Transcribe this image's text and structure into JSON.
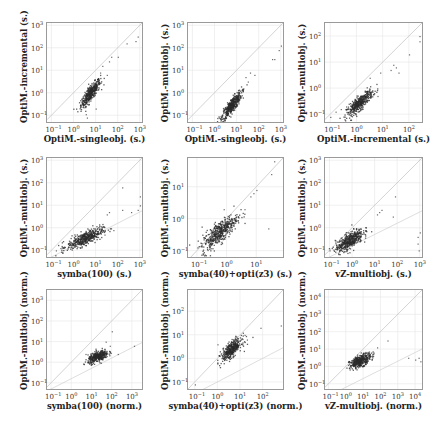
{
  "figure": {
    "layout": {
      "rows": 3,
      "cols": 3
    },
    "colors": {
      "point": "#2b2b2b",
      "diagonal": "#c8c8c8",
      "grid": "#e6e6e6",
      "frame": "#9a9a9a",
      "ratio_line": "#d0d0d0"
    }
  },
  "chart_data": [
    {
      "type": "scatter",
      "id": "p11",
      "xlabel": "OptiM.-singleobj. (s.)",
      "ylabel": "OptiM.-incremental (s.)",
      "xlim_log": [
        -1.2,
        3.1
      ],
      "ylim_log": [
        -1.3,
        3.1
      ],
      "xticks": [
        "-1",
        "0",
        "1",
        "2",
        "3"
      ],
      "yticks": [
        "-1",
        "0",
        "1",
        "2",
        "3"
      ],
      "diagonal": true,
      "ratio_lines": [],
      "cluster": {
        "cx": 0.75,
        "cy": 0.0,
        "sx": 0.22,
        "sy": 0.3,
        "rho": 0.85,
        "n": 420
      },
      "outliers": [
        [
          1.3,
          1.2
        ],
        [
          1.6,
          1.4
        ],
        [
          1.7,
          1.6
        ],
        [
          2.0,
          1.6
        ],
        [
          2.4,
          2.2
        ],
        [
          2.9,
          2.5
        ],
        [
          2.8,
          2.3
        ],
        [
          0.6,
          -1.1
        ],
        [
          0.55,
          -0.95
        ],
        [
          1.0,
          -0.7
        ],
        [
          1.5,
          0.8
        ],
        [
          1.2,
          0.9
        ]
      ],
      "frame": {
        "left": 46,
        "top": 22,
        "width": 97,
        "height": 101
      }
    },
    {
      "type": "scatter",
      "id": "p12",
      "xlabel": "OptiM.-singleobj. (s.)",
      "ylabel": "OptiM.-multiobj. (s.)",
      "xlim_log": [
        -1.2,
        3.1
      ],
      "ylim_log": [
        -1.3,
        3.1
      ],
      "xticks": [
        "-1",
        "0",
        "1",
        "2",
        "3"
      ],
      "yticks": [
        "-1",
        "0",
        "1",
        "2",
        "3"
      ],
      "diagonal": true,
      "ratio_lines": [],
      "cluster": {
        "cx": 0.75,
        "cy": -0.55,
        "sx": 0.22,
        "sy": 0.3,
        "rho": 0.85,
        "n": 420
      },
      "outliers": [
        [
          1.4,
          0.7
        ],
        [
          1.6,
          0.9
        ],
        [
          1.8,
          0.8
        ],
        [
          2.6,
          1.5
        ],
        [
          2.7,
          1.5
        ],
        [
          3.0,
          2.1
        ],
        [
          2.9,
          1.9
        ],
        [
          0.2,
          -1.1
        ],
        [
          1.3,
          0.2
        ],
        [
          1.5,
          0.5
        ]
      ],
      "frame": {
        "left": 187,
        "top": 22,
        "width": 97,
        "height": 101
      }
    },
    {
      "type": "scatter",
      "id": "p13",
      "xlabel": "OptiM.-incremental (s.)",
      "ylabel": "OptiM.-multiobj. (s.)",
      "xlim_log": [
        -1.2,
        2.5
      ],
      "ylim_log": [
        -1.3,
        2.5
      ],
      "xticks": [
        "-1",
        "0",
        "1",
        "2"
      ],
      "yticks": [
        "-1",
        "0",
        "1",
        "2"
      ],
      "diagonal": true,
      "ratio_lines": [],
      "cluster": {
        "cx": 0.1,
        "cy": -0.55,
        "sx": 0.25,
        "sy": 0.25,
        "rho": 0.85,
        "n": 420
      },
      "outliers": [
        [
          -1.0,
          -1.1
        ],
        [
          -0.8,
          -0.9
        ],
        [
          -0.6,
          -0.8
        ],
        [
          -0.4,
          -0.7
        ],
        [
          0.5,
          0.4
        ],
        [
          0.9,
          0.6
        ],
        [
          1.3,
          0.7
        ],
        [
          1.4,
          0.9
        ],
        [
          1.5,
          0.8
        ],
        [
          1.6,
          0.6
        ],
        [
          2.0,
          1.3
        ],
        [
          2.4,
          2.0
        ],
        [
          2.4,
          1.8
        ],
        [
          0.8,
          -0.3
        ]
      ],
      "frame": {
        "left": 324,
        "top": 22,
        "width": 99,
        "height": 101
      }
    },
    {
      "type": "scatter",
      "id": "p21",
      "xlabel": "symba(100) (s.)",
      "ylabel": "OptiM.-multiobj. (s.)",
      "xlim_log": [
        -1.2,
        3.1
      ],
      "ylim_log": [
        -1.3,
        3.1
      ],
      "xticks": [
        "-1",
        "0",
        "1",
        "2",
        "3"
      ],
      "yticks": [
        "-1",
        "0",
        "1",
        "2",
        "3"
      ],
      "diagonal": true,
      "ratio_lines": [
        -2.2
      ],
      "cluster": {
        "cx": 0.5,
        "cy": -0.45,
        "sx": 0.4,
        "sy": 0.22,
        "rho": 0.75,
        "n": 450
      },
      "outliers": [
        [
          -0.6,
          -0.9
        ],
        [
          -0.5,
          -1.1
        ],
        [
          -0.8,
          -1.0
        ],
        [
          1.6,
          0.7
        ],
        [
          1.5,
          0.6
        ],
        [
          2.2,
          0.8
        ],
        [
          2.9,
          0.8
        ],
        [
          3.0,
          1.4
        ],
        [
          3.0,
          1.0
        ],
        [
          2.6,
          0.7
        ],
        [
          1.8,
          -0.1
        ],
        [
          1.4,
          -0.3
        ],
        [
          2.2,
          1.8
        ]
      ],
      "frame": {
        "left": 46,
        "top": 157,
        "width": 97,
        "height": 101
      }
    },
    {
      "type": "scatter",
      "id": "p22",
      "xlabel": "symba(40)+opti(z3) (s.)",
      "ylabel": "OptiM.-multiobj. (s.)",
      "xlim_log": [
        -1.3,
        1.9
      ],
      "ylim_log": [
        -1.2,
        1.9
      ],
      "xticks": [
        "-1",
        "0",
        "1"
      ],
      "yticks": [
        "-1",
        "0",
        "1"
      ],
      "diagonal": true,
      "ratio_lines": [],
      "cluster": {
        "cx": -0.25,
        "cy": -0.4,
        "sx": 0.3,
        "sy": 0.28,
        "rho": 0.8,
        "n": 460
      },
      "outliers": [
        [
          0.9,
          0.8
        ],
        [
          1.0,
          0.9
        ],
        [
          0.8,
          0.7
        ],
        [
          1.5,
          1.4
        ],
        [
          1.6,
          1.8
        ],
        [
          1.4,
          -0.3
        ],
        [
          0.6,
          0.3
        ],
        [
          0.3,
          0.0
        ],
        [
          -0.1,
          0.3
        ]
      ],
      "frame": {
        "left": 187,
        "top": 157,
        "width": 97,
        "height": 101
      }
    },
    {
      "type": "scatter",
      "id": "p23",
      "xlabel": "vZ-multiobj. (s.)",
      "ylabel": "OptiM.-multiobj. (s.)",
      "xlim_log": [
        -1.2,
        3.1
      ],
      "ylim_log": [
        -1.3,
        3.1
      ],
      "xticks": [
        "-1",
        "0",
        "1",
        "2",
        "3"
      ],
      "yticks": [
        "-1",
        "0",
        "1",
        "2",
        "3"
      ],
      "diagonal": true,
      "ratio_lines": [
        -2.2
      ],
      "cluster": {
        "cx": -0.15,
        "cy": -0.55,
        "sx": 0.3,
        "sy": 0.25,
        "rho": 0.7,
        "n": 450
      },
      "outliers": [
        [
          -0.9,
          -0.9
        ],
        [
          -1.0,
          -1.0
        ],
        [
          1.2,
          0.7
        ],
        [
          1.3,
          0.8
        ],
        [
          1.1,
          0.6
        ],
        [
          1.9,
          1.4
        ],
        [
          2.9,
          -0.4
        ],
        [
          2.9,
          -0.7
        ],
        [
          2.95,
          -1.0
        ],
        [
          3.0,
          -0.2
        ],
        [
          0.6,
          -0.1
        ],
        [
          1.8,
          0.5
        ]
      ],
      "frame": {
        "left": 324,
        "top": 157,
        "width": 99,
        "height": 101
      }
    },
    {
      "type": "scatter",
      "id": "p31",
      "xlabel": "symba(100) (norm.)",
      "ylabel": "OptiM.-multiobj. (norm.)",
      "xlim_log": [
        -1.2,
        3.5
      ],
      "ylim_log": [
        -1.3,
        3.5
      ],
      "xticks": [
        "-1",
        "0",
        "1",
        "2",
        "3"
      ],
      "yticks": [
        "-1",
        "0",
        "1",
        "2",
        "3"
      ],
      "diagonal": true,
      "ratio_lines": [
        -2.2
      ],
      "cluster": {
        "cx": 1.3,
        "cy": 0.3,
        "sx": 0.25,
        "sy": 0.15,
        "rho": 0.6,
        "n": 380
      },
      "outliers": [
        [
          2.0,
          1.5
        ],
        [
          1.7,
          1.0
        ],
        [
          1.9,
          0.8
        ],
        [
          3.1,
          0.8
        ],
        [
          0.7,
          0.4
        ],
        [
          2.3,
          0.4
        ]
      ],
      "frame": {
        "left": 46,
        "top": 289,
        "width": 97,
        "height": 101
      }
    },
    {
      "type": "scatter",
      "id": "p32",
      "xlabel": "symba(40)+opti(z3) (norm.)",
      "ylabel": "OptiM.-multiobj. (norm.)",
      "xlim_log": [
        -1.3,
        2.9
      ],
      "ylim_log": [
        -1.3,
        2.9
      ],
      "xticks": [
        "-1",
        "0",
        "1",
        "2"
      ],
      "yticks": [
        "-1",
        "0",
        "1",
        "2"
      ],
      "diagonal": true,
      "ratio_lines": [
        -2.6
      ],
      "cluster": {
        "cx": 0.6,
        "cy": 0.4,
        "sx": 0.22,
        "sy": 0.22,
        "rho": 0.7,
        "n": 400
      },
      "outliers": [
        [
          1.2,
          1.0
        ],
        [
          1.9,
          1.3
        ],
        [
          2.8,
          1.4
        ],
        [
          -1.0,
          -1.1
        ],
        [
          0.0,
          0.6
        ],
        [
          1.3,
          0.8
        ]
      ],
      "frame": {
        "left": 187,
        "top": 289,
        "width": 97,
        "height": 101
      }
    },
    {
      "type": "scatter",
      "id": "p33",
      "xlabel": "vZ-multiobj. (norm.)",
      "ylabel": "OptiM.-multiobj. (norm.)",
      "xlim_log": [
        -1.2,
        4.4
      ],
      "ylim_log": [
        -1.3,
        4.4
      ],
      "xticks": [
        "-1",
        "0",
        "1",
        "2",
        "3",
        "4"
      ],
      "yticks": [
        "-1",
        "0",
        "1",
        "2",
        "3",
        "4"
      ],
      "diagonal": true,
      "ratio_lines": [
        -3.0
      ],
      "cluster": {
        "cx": 0.8,
        "cy": 0.35,
        "sx": 0.3,
        "sy": 0.2,
        "rho": 0.6,
        "n": 400
      },
      "outliers": [
        [
          1.6,
          0.8
        ],
        [
          1.8,
          1.1
        ],
        [
          2.4,
          1.5
        ],
        [
          3.6,
          0.5
        ],
        [
          4.0,
          0.4
        ],
        [
          4.2,
          0.5
        ],
        [
          4.3,
          0.3
        ],
        [
          1.5,
          0.6
        ]
      ],
      "frame": {
        "left": 324,
        "top": 289,
        "width": 99,
        "height": 101
      }
    }
  ]
}
